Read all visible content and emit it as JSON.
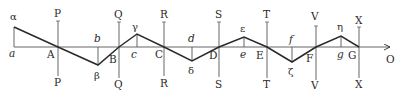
{
  "diagram": {
    "type": "geometric-zigzag-construction",
    "baseline": {
      "y": 47,
      "x_start": 14,
      "x_end": 390,
      "arrow_label": "O",
      "arrow_label_pos": [
        386,
        63
      ]
    },
    "zigzag_points": [
      {
        "name": "alpha",
        "label": "α",
        "x": 14,
        "y": 27,
        "label_pos": [
          10,
          20
        ]
      },
      {
        "name": "A",
        "label": "A",
        "x": 58,
        "y": 47,
        "label_pos": [
          47,
          58
        ]
      },
      {
        "name": "beta",
        "label": "β",
        "x": 98,
        "y": 65,
        "label_pos": [
          94,
          79
        ]
      },
      {
        "name": "B",
        "label": "B",
        "x": 119,
        "y": 47,
        "label_pos": [
          109,
          63
        ]
      },
      {
        "name": "gamma",
        "label": "γ",
        "x": 137,
        "y": 34,
        "label_pos": [
          132,
          30
        ]
      },
      {
        "name": "C",
        "label": "C",
        "x": 164,
        "y": 47,
        "label_pos": [
          155,
          58
        ]
      },
      {
        "name": "delta",
        "label": "δ",
        "x": 192,
        "y": 61,
        "label_pos": [
          188,
          74
        ]
      },
      {
        "name": "D",
        "label": "D",
        "x": 219,
        "y": 47,
        "label_pos": [
          209,
          59
        ]
      },
      {
        "name": "epsilon",
        "label": "ε",
        "x": 244,
        "y": 37,
        "label_pos": [
          240,
          32
        ]
      },
      {
        "name": "E",
        "label": "E",
        "x": 267,
        "y": 47,
        "label_pos": [
          256,
          59
        ]
      },
      {
        "name": "zeta",
        "label": "ζ",
        "x": 292,
        "y": 62,
        "label_pos": [
          288,
          75
        ]
      },
      {
        "name": "F",
        "label": "F",
        "x": 316,
        "y": 47,
        "label_pos": [
          306,
          62
        ]
      },
      {
        "name": "eta",
        "label": "η",
        "x": 341,
        "y": 36,
        "label_pos": [
          337,
          30
        ]
      },
      {
        "name": "G",
        "label": "G",
        "x": 359,
        "y": 47,
        "label_pos": [
          348,
          59
        ]
      }
    ],
    "foot_labels": [
      {
        "label": "a",
        "x": 14,
        "label_pos": [
          9,
          57
        ]
      },
      {
        "label": "b",
        "x": 98,
        "label_pos": [
          94,
          42
        ]
      },
      {
        "label": "c",
        "x": 137,
        "label_pos": [
          131,
          58
        ]
      },
      {
        "label": "d",
        "x": 192,
        "label_pos": [
          188,
          42
        ]
      },
      {
        "label": "e",
        "x": 244,
        "label_pos": [
          240,
          58
        ]
      },
      {
        "label": "f",
        "x": 292,
        "label_pos": [
          289,
          43
        ]
      },
      {
        "label": "g",
        "x": 341,
        "label_pos": [
          337,
          58
        ]
      }
    ],
    "verticals": [
      {
        "label": "P",
        "x": 58,
        "y_top": 21,
        "y_bottom": 76,
        "top_label_pos": [
          54,
          17
        ],
        "bottom_label_pos": [
          54,
          86
        ]
      },
      {
        "label": "Q",
        "x": 119,
        "y_top": 22,
        "y_bottom": 78,
        "top_label_pos": [
          114,
          18
        ],
        "bottom_label_pos": [
          114,
          88
        ]
      },
      {
        "label": "R",
        "x": 164,
        "y_top": 22,
        "y_bottom": 76,
        "top_label_pos": [
          160,
          18
        ],
        "bottom_label_pos": [
          160,
          87
        ]
      },
      {
        "label": "S",
        "x": 219,
        "y_top": 22,
        "y_bottom": 77,
        "top_label_pos": [
          215,
          18
        ],
        "bottom_label_pos": [
          215,
          88
        ]
      },
      {
        "label": "T",
        "x": 267,
        "y_top": 22,
        "y_bottom": 78,
        "top_label_pos": [
          263,
          18
        ],
        "bottom_label_pos": [
          263,
          88
        ]
      },
      {
        "label": "V",
        "x": 316,
        "y_top": 26,
        "y_bottom": 80,
        "top_label_pos": [
          311,
          20
        ],
        "bottom_label_pos": [
          311,
          89
        ]
      },
      {
        "label": "X",
        "x": 359,
        "y_top": 27,
        "y_bottom": 78,
        "top_label_pos": [
          355,
          24
        ],
        "bottom_label_pos": [
          355,
          88
        ]
      }
    ],
    "colors": {
      "line": "#2a2a2a",
      "thin_line": "#555555",
      "text": "#2a2a2a",
      "background": "#ffffff"
    }
  }
}
